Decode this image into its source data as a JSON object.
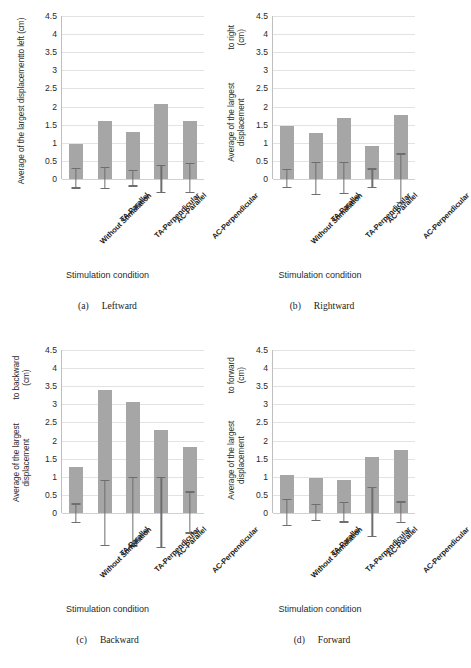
{
  "figure": {
    "background": "#ffffff",
    "bar_color": "#a6a6a6",
    "error_color": "#6e6e6e",
    "grid_color": "#e3e3e3"
  },
  "axis": {
    "yticks": [
      "0",
      "0.5",
      "1",
      "1.5",
      "2",
      "2.5",
      "3",
      "3.5",
      "4",
      "4.5"
    ],
    "ymin": 0,
    "ymax": 4.5,
    "xlabel": "Stimulation condition",
    "categories": [
      "Without Stimulation",
      "TA-Parallel",
      "TA-Perpendicular",
      "AC-Parallel",
      "AC-Perpendicular"
    ]
  },
  "panels": [
    {
      "tag": "(a)",
      "caption": "Leftward",
      "ylabel_line1": "Average of the largest displacement",
      "ylabel_line2": "to left (cm)"
    },
    {
      "tag": "(b)",
      "caption": "Rightward",
      "ylabel_line1": "Average of the largest displacement",
      "ylabel_line2": "to right (cm)"
    },
    {
      "tag": "(c)",
      "caption": "Backward",
      "ylabel_line1": "Average of the largest displacement",
      "ylabel_line2": "to backward (cm)"
    },
    {
      "tag": "(d)",
      "caption": "Forward",
      "ylabel_line1": "Average of the largest displacement",
      "ylabel_line2": "to forward (cm)"
    }
  ],
  "chart_data": [
    {
      "type": "bar",
      "title": "(a) Leftward",
      "xlabel": "Stimulation condition",
      "ylabel": "Average of the largest displacement to left (cm)",
      "ylim": [
        0,
        4.5
      ],
      "ytick_step": 0.5,
      "grid": true,
      "legend": "none",
      "categories": [
        "Without Stimulation",
        "TA-Parallel",
        "TA-Perpendicular",
        "AC-Parallel",
        "AC-Perpendicular"
      ],
      "values": [
        0.97,
        1.6,
        1.31,
        2.06,
        1.6
      ],
      "error_low": [
        0.27,
        0.28,
        0.21,
        0.4,
        0.39
      ],
      "error_high": [
        0.28,
        0.3,
        0.21,
        0.36,
        0.41
      ]
    },
    {
      "type": "bar",
      "title": "(b) Rightward",
      "xlabel": "Stimulation condition",
      "ylabel": "Average of the largest displacement to right (cm)",
      "ylim": [
        0,
        4.5
      ],
      "ytick_step": 0.5,
      "grid": true,
      "legend": "none",
      "categories": [
        "Without Stimulation",
        "TA-Parallel",
        "TA-Perpendicular",
        "AC-Parallel",
        "AC-Perpendicular"
      ],
      "values": [
        1.45,
        1.28,
        1.69,
        0.92,
        1.78
      ],
      "error_low": [
        0.25,
        0.44,
        0.42,
        0.25,
        0.66
      ],
      "error_high": [
        0.25,
        0.43,
        0.43,
        0.26,
        0.67
      ]
    },
    {
      "type": "bar",
      "title": "(c) Backward",
      "xlabel": "Stimulation condition",
      "ylabel": "Average of the largest displacement to backward (cm)",
      "ylim": [
        0,
        4.5
      ],
      "ytick_step": 0.5,
      "grid": true,
      "legend": "none",
      "categories": [
        "Without Stimulation",
        "TA-Parallel",
        "TA-Perpendicular",
        "AC-Parallel",
        "AC-Perpendicular"
      ],
      "values": [
        1.28,
        3.39,
        3.07,
        2.29,
        1.81
      ],
      "error_low": [
        0.28,
        0.91,
        0.93,
        0.98,
        0.57
      ],
      "error_high": [
        0.23,
        0.88,
        0.96,
        0.97,
        0.56
      ]
    },
    {
      "type": "bar",
      "title": "(d) Forward",
      "xlabel": "Stimulation condition",
      "ylabel": "Average of the largest displacement to forward (cm)",
      "ylim": [
        0,
        4.5
      ],
      "ytick_step": 0.5,
      "grid": true,
      "legend": "none",
      "categories": [
        "Without Stimulation",
        "TA-Parallel",
        "TA-Perpendicular",
        "AC-Parallel",
        "AC-Perpendicular"
      ],
      "values": [
        1.05,
        0.97,
        0.91,
        1.54,
        1.75
      ],
      "error_low": [
        0.36,
        0.22,
        0.27,
        0.67,
        0.28
      ],
      "error_high": [
        0.36,
        0.22,
        0.27,
        0.68,
        0.29
      ]
    }
  ]
}
